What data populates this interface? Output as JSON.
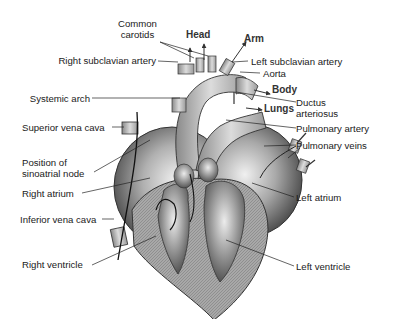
{
  "diagram": {
    "type": "anatomy-illustration",
    "labels_left": {
      "common_carotids": "Common\ncarotids",
      "common_carotids_line1": "Common",
      "common_carotids_line2": "carotids",
      "right_subclavian_artery": "Right subclavian artery",
      "systemic_arch": "Systemic arch",
      "superior_vena_cava": "Superior vena cava",
      "sinoatrial_node_line1": "Position of",
      "sinoatrial_node_line2": "sinoatrial node",
      "right_atrium": "Right atrium",
      "inferior_vena_cava": "Inferior vena cava",
      "right_ventricle": "Right ventricle"
    },
    "labels_right": {
      "left_subclavian_artery": "Left subclavian artery",
      "aorta": "Aorta",
      "ductus_line1": "Ductus",
      "ductus_line2": "arteriosus",
      "pulmonary_artery": "Pulmonary artery",
      "pulmonary_veins": "Pulmonary veins",
      "left_atrium": "Left atrium",
      "left_ventricle": "Left ventricle"
    },
    "flow_labels": {
      "head": "Head",
      "arm": "Arm",
      "body": "Body",
      "lungs": "Lungs"
    },
    "colors": {
      "line": "#222222",
      "tissue_gray": "#9a9a9a",
      "vessel_light": "#d4d4d4",
      "chamber_dark": "#5a5a5a"
    }
  }
}
